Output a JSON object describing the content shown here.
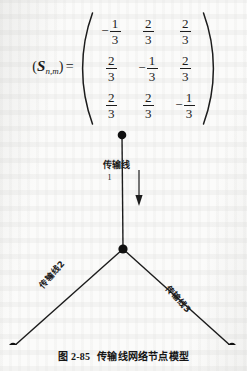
{
  "equation": {
    "lhs_symbol": "S",
    "lhs_subscript": "n,m",
    "lhs_open": "(",
    "lhs_close": ")",
    "equals": "=",
    "matrix": {
      "rows": 3,
      "cols": 3,
      "entries": [
        [
          {
            "sign": "−",
            "numerator": "1",
            "denominator": "3"
          },
          {
            "sign": "",
            "numerator": "2",
            "denominator": "3"
          },
          {
            "sign": "",
            "numerator": "2",
            "denominator": "3"
          }
        ],
        [
          {
            "sign": "",
            "numerator": "2",
            "denominator": "3"
          },
          {
            "sign": "−",
            "numerator": "1",
            "denominator": "3"
          },
          {
            "sign": "",
            "numerator": "2",
            "denominator": "3"
          }
        ],
        [
          {
            "sign": "",
            "numerator": "2",
            "denominator": "3"
          },
          {
            "sign": "",
            "numerator": "2",
            "denominator": "3"
          },
          {
            "sign": "−",
            "numerator": "1",
            "denominator": "3"
          }
        ]
      ]
    }
  },
  "diagram": {
    "labels": {
      "line1_text": "传输线",
      "line1_index": "1",
      "line2": "传输线2",
      "line3": "传输线3"
    },
    "nodes": [
      {
        "name": "top-terminal",
        "x": 122,
        "y": 5
      },
      {
        "name": "junction",
        "x": 123,
        "y": 119
      },
      {
        "name": "bottom-left-terminal",
        "x": 13,
        "y": 217
      },
      {
        "name": "bottom-right-terminal",
        "x": 232,
        "y": 217
      }
    ],
    "arrow": {
      "direction": "down",
      "x": 139,
      "y_start": 40,
      "y_end": 75
    },
    "line_color": "#1c1c1c",
    "node_color": "#101010"
  },
  "caption": {
    "figure_number": "图 2-85",
    "text": "传输线网络节点模型"
  }
}
